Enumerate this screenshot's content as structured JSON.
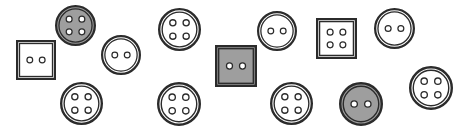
{
  "scene": {
    "title": "Scattered sewing buttons",
    "width": 457,
    "height": 132,
    "background_color": "#ffffff",
    "item_count": 14
  },
  "palette": {
    "outline": "#2b2b2b",
    "fill_white": "#ffffff",
    "fill_gray": "#9e9e9e",
    "hole_fill": "#ffffff",
    "hole_outline": "#2b2b2b"
  },
  "buttons": [
    {
      "id": "button-1",
      "name": "square-2-hole-white",
      "shape": "square",
      "holes": 2,
      "fill": "white",
      "x": 16,
      "y": 40,
      "size": 40,
      "label": "White square button with 2 holes"
    },
    {
      "id": "button-2",
      "name": "round-4-hole-gray",
      "shape": "round",
      "holes": 4,
      "fill": "gray",
      "x": 55,
      "y": 5,
      "size": 41,
      "label": "Gray round button with 4 holes"
    },
    {
      "id": "button-3",
      "name": "round-2-hole-white",
      "shape": "round",
      "holes": 2,
      "fill": "white",
      "x": 101,
      "y": 35,
      "size": 40,
      "label": "White round button with 2 holes"
    },
    {
      "id": "button-4",
      "name": "round-4-hole-white",
      "shape": "round",
      "holes": 4,
      "fill": "white",
      "x": 158,
      "y": 8,
      "size": 43,
      "label": "White round button with 4 holes"
    },
    {
      "id": "button-5",
      "name": "round-4-hole-white",
      "shape": "round",
      "holes": 4,
      "fill": "white",
      "x": 60,
      "y": 82,
      "size": 43,
      "label": "White round button with 4 holes"
    },
    {
      "id": "button-6",
      "name": "round-4-hole-white",
      "shape": "round",
      "holes": 4,
      "fill": "white",
      "x": 157,
      "y": 82,
      "size": 44,
      "label": "White round button with 4 holes"
    },
    {
      "id": "button-7",
      "name": "square-2-hole-gray",
      "shape": "square",
      "holes": 2,
      "fill": "gray",
      "x": 215,
      "y": 45,
      "size": 42,
      "label": "Gray square button with 2 holes"
    },
    {
      "id": "button-8",
      "name": "round-2-hole-white",
      "shape": "round",
      "holes": 2,
      "fill": "white",
      "x": 257,
      "y": 11,
      "size": 40,
      "label": "White round button with 2 holes"
    },
    {
      "id": "button-9",
      "name": "round-4-hole-white",
      "shape": "round",
      "holes": 4,
      "fill": "white",
      "x": 270,
      "y": 82,
      "size": 43,
      "label": "White round button with 4 holes"
    },
    {
      "id": "button-10",
      "name": "square-4-hole-white",
      "shape": "square",
      "holes": 4,
      "fill": "white",
      "x": 316,
      "y": 18,
      "size": 41,
      "label": "White square button with 4 holes"
    },
    {
      "id": "button-11",
      "name": "round-2-hole-gray",
      "shape": "round",
      "holes": 2,
      "fill": "gray",
      "x": 339,
      "y": 82,
      "size": 44,
      "label": "Gray round button with 2 holes"
    },
    {
      "id": "button-12",
      "name": "round-2-hole-white",
      "shape": "round",
      "holes": 2,
      "fill": "white",
      "x": 374,
      "y": 8,
      "size": 41,
      "label": "White round button with 2 holes"
    },
    {
      "id": "button-13",
      "name": "round-4-hole-white",
      "shape": "round",
      "holes": 4,
      "fill": "white",
      "x": 409,
      "y": 66,
      "size": 44,
      "label": "White round button with 4 holes"
    }
  ]
}
